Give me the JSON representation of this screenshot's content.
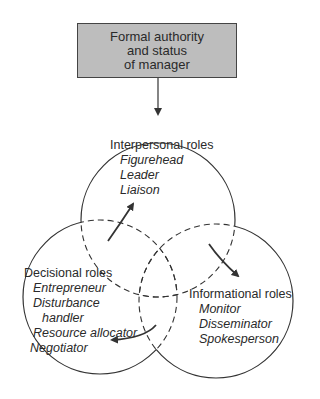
{
  "diagram": {
    "top_box": {
      "lines": [
        "Formal authority",
        "and status",
        "of manager"
      ],
      "fill_color": "#bdbdbd"
    },
    "circles": [
      {
        "id": "interpersonal",
        "title": "Interpersonal roles",
        "items": [
          "Figurehead",
          "Leader",
          "Liaison"
        ]
      },
      {
        "id": "decisional",
        "title": "Decisional roles",
        "items": [
          "Entrepreneur",
          "Disturbance",
          "handler",
          "Resource allocator",
          "Negotiator"
        ]
      },
      {
        "id": "informational",
        "title": "Informational roles",
        "items": [
          "Monitor",
          "Disseminator",
          "Spokesperson"
        ]
      }
    ],
    "flows": [
      {
        "from": "top_box",
        "to": "interpersonal"
      },
      {
        "from": "decisional",
        "to": "interpersonal"
      },
      {
        "from": "interpersonal",
        "to": "informational"
      },
      {
        "from": "informational",
        "to": "decisional"
      }
    ]
  }
}
